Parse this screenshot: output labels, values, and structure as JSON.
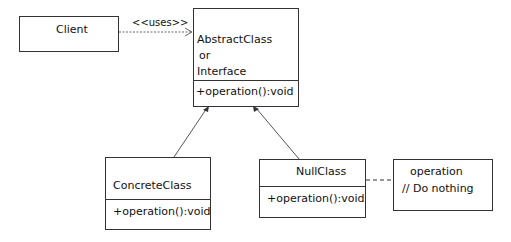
{
  "diagram": {
    "type": "UML class diagram - Null Object pattern",
    "client": {
      "name": "Client"
    },
    "uses_label": "<<uses>>",
    "abstract": {
      "line1": "AbstractClass",
      "line2": "or",
      "line3": "Interface",
      "method": "+operation():void"
    },
    "concrete": {
      "name": "ConcreteClass",
      "method": "+operation():void"
    },
    "nullclass": {
      "name": "NullClass",
      "method": "+operation():void"
    },
    "note": {
      "line1": "operation",
      "line2": "// Do nothing"
    },
    "colors": {
      "line": "#333333",
      "background": "#ffffff"
    }
  }
}
